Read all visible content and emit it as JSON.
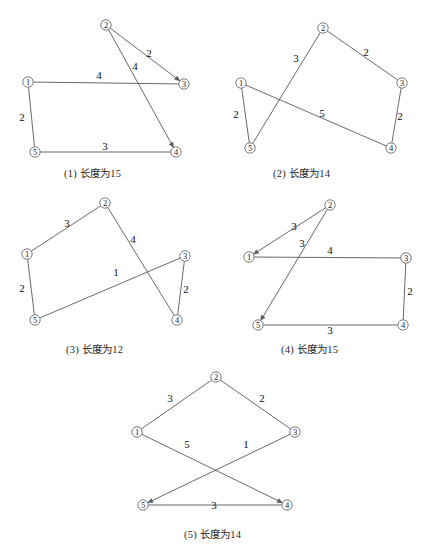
{
  "document": {
    "type": "graph-figure-sheet",
    "description": "Five small graph diagrams with numbered vertices and edge weights",
    "ink_color": "#595959",
    "text_color": "#1a1a1a"
  },
  "panels": [
    {
      "id": "panel-1",
      "caption": "(1) 长度为15",
      "caption_x": 64,
      "caption_y": 165,
      "nodes": [
        {
          "label": "①",
          "x": 28,
          "y": 82
        },
        {
          "label": "②",
          "x": 106,
          "y": 25
        },
        {
          "label": "③",
          "x": 184,
          "y": 84
        },
        {
          "label": "④",
          "x": 176,
          "y": 152
        },
        {
          "label": "⑤",
          "x": 35,
          "y": 152
        }
      ],
      "edges": [
        {
          "from": 0,
          "to": 2,
          "weight": "4",
          "lx": 99,
          "ly": 75,
          "arrow": false
        },
        {
          "from": 1,
          "to": 2,
          "weight": "2",
          "lx": 149,
          "ly": 53,
          "arrow": true
        },
        {
          "from": 1,
          "to": 3,
          "weight": "4",
          "lx": 135,
          "ly": 66,
          "arrow": true
        },
        {
          "from": 0,
          "to": 4,
          "weight": "2",
          "lx": 22,
          "ly": 117,
          "arrow": false
        },
        {
          "from": 4,
          "to": 3,
          "weight": "3",
          "lx": 105,
          "ly": 146,
          "arrow": false
        }
      ]
    },
    {
      "id": "panel-2",
      "caption": "(2) 长度为14",
      "caption_x": 273,
      "caption_y": 165,
      "nodes": [
        {
          "label": "①",
          "x": 241,
          "y": 83
        },
        {
          "label": "②",
          "x": 323,
          "y": 28
        },
        {
          "label": "③",
          "x": 402,
          "y": 83
        },
        {
          "label": "④",
          "x": 391,
          "y": 148
        },
        {
          "label": "⑤",
          "x": 250,
          "y": 148
        }
      ],
      "edges": [
        {
          "from": 4,
          "to": 1,
          "weight": "3",
          "lx": 296,
          "ly": 58,
          "arrow": false
        },
        {
          "from": 1,
          "to": 2,
          "weight": "2",
          "lx": 366,
          "ly": 52,
          "arrow": false
        },
        {
          "from": 0,
          "to": 4,
          "weight": "2",
          "lx": 236,
          "ly": 114,
          "arrow": false
        },
        {
          "from": 0,
          "to": 3,
          "weight": "5",
          "lx": 322,
          "ly": 113,
          "arrow": false
        },
        {
          "from": 2,
          "to": 3,
          "weight": "2",
          "lx": 400,
          "ly": 116,
          "arrow": false
        }
      ]
    },
    {
      "id": "panel-3",
      "caption": "(3) 长度为12",
      "caption_x": 66,
      "caption_y": 341,
      "nodes": [
        {
          "label": "①",
          "x": 27,
          "y": 254
        },
        {
          "label": "②",
          "x": 105,
          "y": 203
        },
        {
          "label": "③",
          "x": 185,
          "y": 256
        },
        {
          "label": "④",
          "x": 177,
          "y": 320
        },
        {
          "label": "⑤",
          "x": 35,
          "y": 320
        }
      ],
      "edges": [
        {
          "from": 0,
          "to": 1,
          "weight": "3",
          "lx": 67,
          "ly": 223,
          "arrow": false
        },
        {
          "from": 1,
          "to": 3,
          "weight": "4",
          "lx": 133,
          "ly": 239,
          "arrow": false
        },
        {
          "from": 0,
          "to": 4,
          "weight": "2",
          "lx": 22,
          "ly": 288,
          "arrow": false
        },
        {
          "from": 4,
          "to": 2,
          "weight": "1",
          "lx": 116,
          "ly": 272,
          "arrow": false
        },
        {
          "from": 2,
          "to": 3,
          "weight": "2",
          "lx": 186,
          "ly": 289,
          "arrow": false
        }
      ]
    },
    {
      "id": "panel-4",
      "caption": "(4) 长度为15",
      "caption_x": 281,
      "caption_y": 341,
      "nodes": [
        {
          "label": "①",
          "x": 249,
          "y": 257
        },
        {
          "label": "②",
          "x": 330,
          "y": 205
        },
        {
          "label": "③",
          "x": 406,
          "y": 258
        },
        {
          "label": "④",
          "x": 403,
          "y": 325
        },
        {
          "label": "⑤",
          "x": 258,
          "y": 325
        }
      ],
      "edges": [
        {
          "from": 1,
          "to": 0,
          "weight": "3",
          "lx": 294,
          "ly": 226,
          "arrow": true
        },
        {
          "from": 1,
          "to": 4,
          "weight": "3",
          "lx": 302,
          "ly": 243,
          "arrow": true
        },
        {
          "from": 0,
          "to": 2,
          "weight": "4",
          "lx": 330,
          "ly": 250,
          "arrow": false
        },
        {
          "from": 2,
          "to": 3,
          "weight": "2",
          "lx": 410,
          "ly": 291,
          "arrow": false
        },
        {
          "from": 4,
          "to": 3,
          "weight": "3",
          "lx": 330,
          "ly": 330,
          "arrow": false
        }
      ]
    },
    {
      "id": "panel-5",
      "caption": "(5) 长度为14",
      "caption_x": 184,
      "caption_y": 526,
      "nodes": [
        {
          "label": "①",
          "x": 137,
          "y": 432
        },
        {
          "label": "②",
          "x": 216,
          "y": 377
        },
        {
          "label": "③",
          "x": 295,
          "y": 432
        },
        {
          "label": "④",
          "x": 287,
          "y": 505
        },
        {
          "label": "⑤",
          "x": 143,
          "y": 505
        }
      ],
      "edges": [
        {
          "from": 0,
          "to": 1,
          "weight": "3",
          "lx": 170,
          "ly": 398,
          "arrow": false
        },
        {
          "from": 1,
          "to": 2,
          "weight": "2",
          "lx": 262,
          "ly": 398,
          "arrow": false
        },
        {
          "from": 0,
          "to": 3,
          "weight": "5",
          "lx": 187,
          "ly": 444,
          "arrow": true
        },
        {
          "from": 2,
          "to": 4,
          "weight": "1",
          "lx": 246,
          "ly": 444,
          "arrow": true
        },
        {
          "from": 4,
          "to": 3,
          "weight": "3",
          "lx": 214,
          "ly": 505,
          "arrow": false
        }
      ]
    }
  ]
}
